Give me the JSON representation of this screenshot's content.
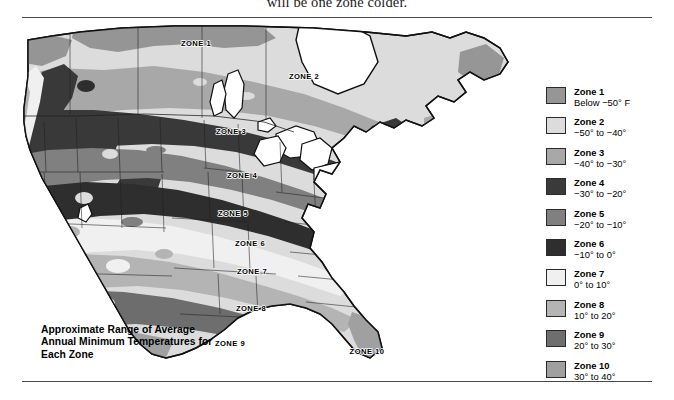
{
  "top_caption": "will be one zone colder.",
  "map_caption": "Approximate Range of Average Annual Minimum Temperatures for Each Zone",
  "map": {
    "zone_labels": [
      {
        "text": "ZONE 1",
        "x": 182,
        "y": 24
      },
      {
        "text": "ZONE 2",
        "x": 290,
        "y": 57
      },
      {
        "text": "ZONE 3",
        "x": 217,
        "y": 112
      },
      {
        "text": "ZONE 4",
        "x": 228,
        "y": 156
      },
      {
        "text": "ZONE 5",
        "x": 219,
        "y": 194
      },
      {
        "text": "ZONE 6",
        "x": 236,
        "y": 224
      },
      {
        "text": "ZONE 7",
        "x": 238,
        "y": 252
      },
      {
        "text": "ZONE 8",
        "x": 237,
        "y": 289
      },
      {
        "text": "ZONE 9",
        "x": 216,
        "y": 324
      },
      {
        "text": "ZONE 10",
        "x": 353,
        "y": 332
      }
    ]
  },
  "legend": {
    "items": [
      {
        "title": "Zone 1",
        "range": "Below −50° F",
        "color": "#969696"
      },
      {
        "title": "Zone 2",
        "range": "−50° to −40°",
        "color": "#dcdcdc"
      },
      {
        "title": "Zone 3",
        "range": "−40° to −30°",
        "color": "#a8a8a8"
      },
      {
        "title": "Zone 4",
        "range": "−30° to −20°",
        "color": "#3a3a3a"
      },
      {
        "title": "Zone 5",
        "range": "−20° to −10°",
        "color": "#808080"
      },
      {
        "title": "Zone 6",
        "range": "−10° to 0°",
        "color": "#2e2e2e"
      },
      {
        "title": "Zone 7",
        "range": "0° to 10°",
        "color": "#f0f0f0"
      },
      {
        "title": "Zone 8",
        "range": "10° to 20°",
        "color": "#b4b4b4"
      },
      {
        "title": "Zone 9",
        "range": "20° to 30°",
        "color": "#6e6e6e"
      },
      {
        "title": "Zone 10",
        "range": "30° to 40°",
        "color": "#a0a0a0"
      }
    ]
  },
  "chart_data": {
    "type": "map",
    "title": "Approximate Range of Average Annual Minimum Temperatures for Each Zone",
    "region": "North America (Canada, United States, northern Mexico)",
    "variable": "Average annual minimum temperature (plant hardiness zone)",
    "units": "°F",
    "categories": [
      "Zone 1",
      "Zone 2",
      "Zone 3",
      "Zone 4",
      "Zone 5",
      "Zone 6",
      "Zone 7",
      "Zone 8",
      "Zone 9",
      "Zone 10"
    ],
    "bins": [
      {
        "zone": 1,
        "label": "Below −50° F",
        "min": null,
        "max": -50,
        "color": "#969696"
      },
      {
        "zone": 2,
        "label": "−50° to −40°",
        "min": -50,
        "max": -40,
        "color": "#dcdcdc"
      },
      {
        "zone": 3,
        "label": "−40° to −30°",
        "min": -40,
        "max": -30,
        "color": "#a8a8a8"
      },
      {
        "zone": 4,
        "label": "−30° to −20°",
        "min": -30,
        "max": -20,
        "color": "#3a3a3a"
      },
      {
        "zone": 5,
        "label": "−20° to −10°",
        "min": -20,
        "max": -10,
        "color": "#808080"
      },
      {
        "zone": 6,
        "label": "−10° to 0°",
        "min": -10,
        "max": 0,
        "color": "#2e2e2e"
      },
      {
        "zone": 7,
        "label": "0° to 10°",
        "min": 0,
        "max": 10,
        "color": "#f0f0f0"
      },
      {
        "zone": 8,
        "label": "10° to 20°",
        "min": 10,
        "max": 20,
        "color": "#b4b4b4"
      },
      {
        "zone": 9,
        "label": "20° to 30°",
        "min": 20,
        "max": 30,
        "color": "#6e6e6e"
      },
      {
        "zone": 10,
        "label": "30° to 40°",
        "min": 30,
        "max": 40,
        "color": "#a0a0a0"
      }
    ],
    "legend_position": "right",
    "grid": false
  }
}
